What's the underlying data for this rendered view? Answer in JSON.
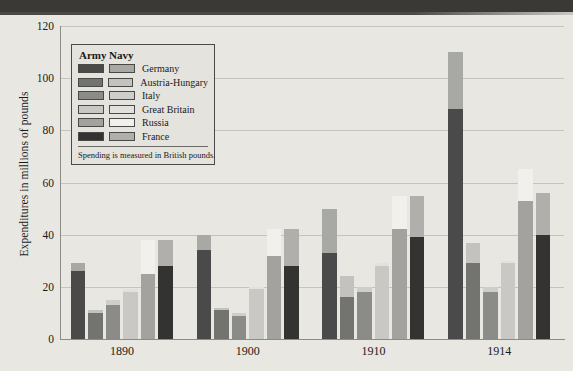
{
  "chart_data": {
    "type": "bar",
    "title": "",
    "subtitle": "",
    "xlabel": "",
    "ylabel": "Expenditures in millions of pounds",
    "ylim": [
      0,
      120
    ],
    "yticks": [
      0,
      20,
      40,
      60,
      80,
      100,
      120
    ],
    "grid": true,
    "stacked": true,
    "legend_position": "inside-top-left",
    "legend_title_army": "Army",
    "legend_title_navy": "Navy",
    "legend_note": "Spending is measured in British pounds.",
    "categories": [
      "1890",
      "1900",
      "1910",
      "1914"
    ],
    "countries": [
      "Germany",
      "Austria-Hungary",
      "Italy",
      "Great Britain",
      "Russia",
      "France"
    ],
    "colors": {
      "germany_army": "#4a4a4a",
      "germany_navy": "#a8a8a4",
      "austria_army": "#737370",
      "austria_navy": "#c3c2be",
      "italy_army": "#8b8b87",
      "italy_navy": "#cfcecb",
      "britain_army": "#c9c8c4",
      "britain_navy": "#e2e1dd",
      "russia_army": "#a3a29e",
      "russia_navy": "#f1f0ec",
      "france_army": "#333331",
      "france_navy": "#b0afab"
    },
    "series": [
      {
        "name": "Germany",
        "army_values": [
          26,
          34,
          33,
          88
        ],
        "navy_values": [
          3,
          6,
          17,
          22
        ],
        "total_values": [
          29,
          40,
          50,
          110
        ]
      },
      {
        "name": "Austria-Hungary",
        "army_values": [
          10,
          11,
          16,
          29
        ],
        "navy_values": [
          1,
          1,
          8,
          8
        ],
        "total_values": [
          11,
          12,
          24,
          37
        ]
      },
      {
        "name": "Italy",
        "army_values": [
          13,
          9,
          18,
          18
        ],
        "navy_values": [
          2,
          1,
          2,
          2
        ],
        "total_values": [
          15,
          10,
          20,
          20
        ]
      },
      {
        "name": "Great Britain",
        "army_values": [
          18,
          19,
          28,
          29
        ],
        "navy_values": [
          1,
          1,
          1,
          1
        ],
        "total_values": [
          19,
          20,
          29,
          30
        ]
      },
      {
        "name": "Russia",
        "army_values": [
          25,
          32,
          42,
          53
        ],
        "navy_values": [
          13,
          10,
          13,
          12
        ],
        "total_values": [
          38,
          42,
          55,
          65
        ]
      },
      {
        "name": "France",
        "army_values": [
          28,
          28,
          39,
          40
        ],
        "navy_values": [
          10,
          14,
          16,
          16
        ],
        "total_values": [
          38,
          42,
          55,
          56
        ]
      }
    ],
    "legend_entries": [
      {
        "label": "Germany",
        "army_color": "#4a4a4a",
        "navy_color": "#a8a8a4"
      },
      {
        "label": "Austria-Hungary",
        "army_color": "#737370",
        "navy_color": "#c3c2be"
      },
      {
        "label": "Italy",
        "army_color": "#8b8b87",
        "navy_color": "#cfcecb"
      },
      {
        "label": "Great Britain",
        "army_color": "#c9c8c4",
        "navy_color": "#e2e1dd"
      },
      {
        "label": "Russia",
        "army_color": "#a3a29e",
        "navy_color": "#f1f0ec"
      },
      {
        "label": "France",
        "army_color": "#333331",
        "navy_color": "#b0afab"
      }
    ]
  }
}
